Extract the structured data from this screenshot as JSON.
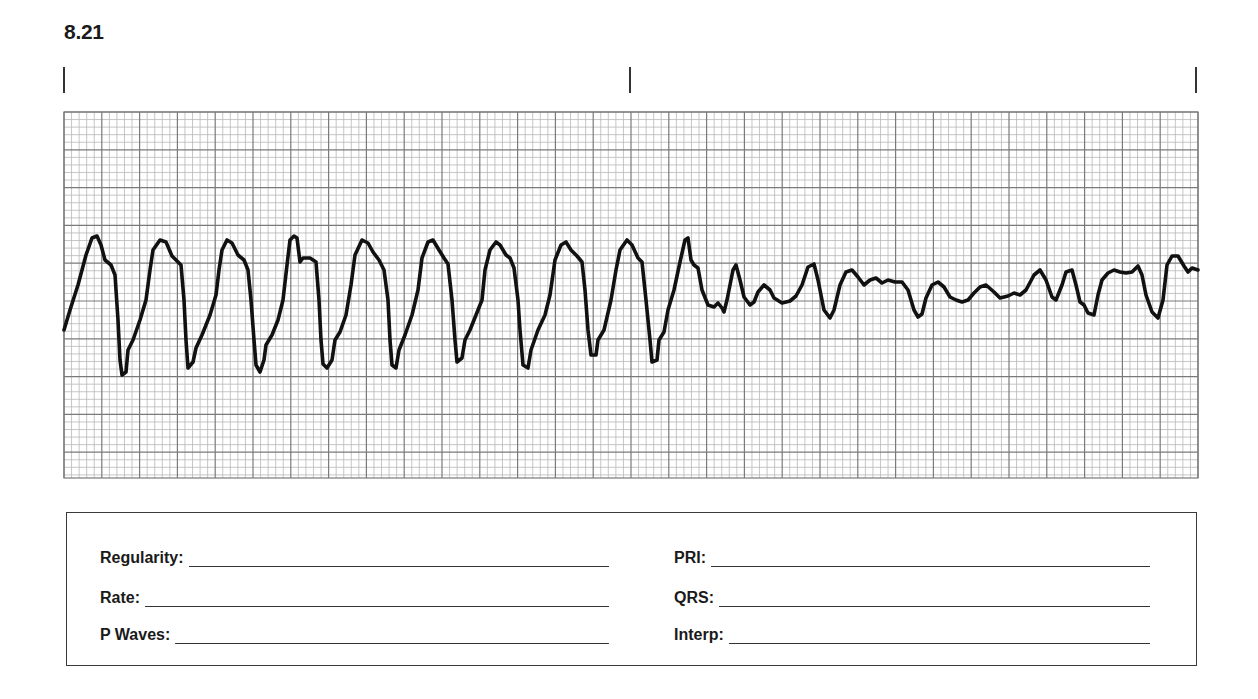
{
  "strip": {
    "number": "8.21",
    "tick_marks_x": [
      64,
      630,
      1196
    ],
    "grid": {
      "x0": 64,
      "y0": 112,
      "x1": 1198,
      "y1": 478,
      "minor_px": 7.56,
      "major_every": 5,
      "minor_color": "#b8b8b8",
      "major_color": "#7a7a7a"
    },
    "trace_color": "#111111"
  },
  "chart_data": {
    "type": "line",
    "title": "8.21",
    "xlabel": "",
    "ylabel": "",
    "grid": true,
    "trace_points": [
      [
        64,
        330
      ],
      [
        70,
        310
      ],
      [
        78,
        285
      ],
      [
        86,
        255
      ],
      [
        92,
        238
      ],
      [
        97,
        236
      ],
      [
        101,
        245
      ],
      [
        105,
        260
      ],
      [
        111,
        265
      ],
      [
        115,
        275
      ],
      [
        118,
        320
      ],
      [
        120,
        360
      ],
      [
        122,
        375
      ],
      [
        126,
        372
      ],
      [
        128,
        350
      ],
      [
        133,
        340
      ],
      [
        140,
        320
      ],
      [
        146,
        300
      ],
      [
        150,
        270
      ],
      [
        153,
        250
      ],
      [
        160,
        240
      ],
      [
        166,
        242
      ],
      [
        172,
        256
      ],
      [
        176,
        260
      ],
      [
        181,
        265
      ],
      [
        184,
        300
      ],
      [
        186,
        340
      ],
      [
        188,
        368
      ],
      [
        193,
        362
      ],
      [
        196,
        348
      ],
      [
        202,
        335
      ],
      [
        210,
        315
      ],
      [
        216,
        295
      ],
      [
        219,
        270
      ],
      [
        222,
        250
      ],
      [
        227,
        240
      ],
      [
        232,
        243
      ],
      [
        238,
        255
      ],
      [
        244,
        260
      ],
      [
        248,
        270
      ],
      [
        251,
        300
      ],
      [
        254,
        340
      ],
      [
        256,
        365
      ],
      [
        260,
        372
      ],
      [
        264,
        360
      ],
      [
        266,
        345
      ],
      [
        272,
        335
      ],
      [
        278,
        320
      ],
      [
        283,
        300
      ],
      [
        287,
        265
      ],
      [
        290,
        240
      ],
      [
        294,
        236
      ],
      [
        297,
        238
      ],
      [
        300,
        262
      ],
      [
        303,
        258
      ],
      [
        310,
        258
      ],
      [
        316,
        262
      ],
      [
        319,
        300
      ],
      [
        321,
        340
      ],
      [
        323,
        364
      ],
      [
        327,
        368
      ],
      [
        332,
        360
      ],
      [
        335,
        340
      ],
      [
        340,
        332
      ],
      [
        346,
        315
      ],
      [
        351,
        285
      ],
      [
        355,
        255
      ],
      [
        362,
        240
      ],
      [
        368,
        243
      ],
      [
        373,
        252
      ],
      [
        379,
        260
      ],
      [
        384,
        270
      ],
      [
        388,
        300
      ],
      [
        390,
        340
      ],
      [
        392,
        365
      ],
      [
        396,
        368
      ],
      [
        399,
        350
      ],
      [
        405,
        335
      ],
      [
        412,
        315
      ],
      [
        418,
        290
      ],
      [
        422,
        258
      ],
      [
        428,
        242
      ],
      [
        433,
        240
      ],
      [
        439,
        250
      ],
      [
        444,
        258
      ],
      [
        448,
        264
      ],
      [
        452,
        300
      ],
      [
        455,
        340
      ],
      [
        457,
        362
      ],
      [
        462,
        358
      ],
      [
        465,
        340
      ],
      [
        470,
        330
      ],
      [
        476,
        315
      ],
      [
        482,
        300
      ],
      [
        485,
        270
      ],
      [
        490,
        250
      ],
      [
        496,
        242
      ],
      [
        500,
        245
      ],
      [
        506,
        255
      ],
      [
        510,
        258
      ],
      [
        514,
        268
      ],
      [
        518,
        300
      ],
      [
        520,
        330
      ],
      [
        523,
        365
      ],
      [
        528,
        368
      ],
      [
        531,
        350
      ],
      [
        538,
        330
      ],
      [
        545,
        315
      ],
      [
        550,
        295
      ],
      [
        555,
        260
      ],
      [
        561,
        245
      ],
      [
        566,
        242
      ],
      [
        571,
        250
      ],
      [
        577,
        256
      ],
      [
        582,
        262
      ],
      [
        585,
        290
      ],
      [
        588,
        330
      ],
      [
        591,
        355
      ],
      [
        596,
        355
      ],
      [
        598,
        340
      ],
      [
        604,
        330
      ],
      [
        611,
        300
      ],
      [
        616,
        270
      ],
      [
        620,
        250
      ],
      [
        627,
        240
      ],
      [
        632,
        245
      ],
      [
        638,
        258
      ],
      [
        642,
        262
      ],
      [
        646,
        300
      ],
      [
        650,
        340
      ],
      [
        652,
        362
      ],
      [
        657,
        360
      ],
      [
        659,
        340
      ],
      [
        664,
        332
      ],
      [
        668,
        310
      ],
      [
        674,
        290
      ],
      [
        680,
        262
      ],
      [
        685,
        240
      ],
      [
        688,
        238
      ],
      [
        691,
        260
      ],
      [
        694,
        265
      ],
      [
        698,
        268
      ],
      [
        702,
        290
      ],
      [
        708,
        305
      ],
      [
        714,
        307
      ],
      [
        718,
        303
      ],
      [
        722,
        308
      ],
      [
        724,
        312
      ],
      [
        727,
        300
      ],
      [
        733,
        270
      ],
      [
        736,
        265
      ],
      [
        740,
        280
      ],
      [
        744,
        297
      ],
      [
        750,
        305
      ],
      [
        754,
        302
      ],
      [
        758,
        292
      ],
      [
        764,
        285
      ],
      [
        770,
        290
      ],
      [
        774,
        298
      ],
      [
        782,
        303
      ],
      [
        790,
        301
      ],
      [
        796,
        296
      ],
      [
        802,
        285
      ],
      [
        808,
        267
      ],
      [
        814,
        264
      ],
      [
        818,
        280
      ],
      [
        824,
        310
      ],
      [
        830,
        318
      ],
      [
        834,
        310
      ],
      [
        840,
        285
      ],
      [
        846,
        272
      ],
      [
        852,
        270
      ],
      [
        858,
        277
      ],
      [
        864,
        285
      ],
      [
        870,
        280
      ],
      [
        876,
        278
      ],
      [
        882,
        283
      ],
      [
        888,
        280
      ],
      [
        895,
        282
      ],
      [
        902,
        282
      ],
      [
        908,
        290
      ],
      [
        914,
        310
      ],
      [
        918,
        317
      ],
      [
        922,
        314
      ],
      [
        926,
        298
      ],
      [
        932,
        285
      ],
      [
        938,
        282
      ],
      [
        944,
        287
      ],
      [
        950,
        297
      ],
      [
        956,
        300
      ],
      [
        962,
        302
      ],
      [
        968,
        300
      ],
      [
        974,
        293
      ],
      [
        980,
        287
      ],
      [
        986,
        285
      ],
      [
        994,
        292
      ],
      [
        1000,
        298
      ],
      [
        1008,
        296
      ],
      [
        1014,
        293
      ],
      [
        1020,
        295
      ],
      [
        1026,
        290
      ],
      [
        1034,
        275
      ],
      [
        1040,
        270
      ],
      [
        1046,
        280
      ],
      [
        1052,
        297
      ],
      [
        1056,
        300
      ],
      [
        1062,
        285
      ],
      [
        1066,
        272
      ],
      [
        1072,
        270
      ],
      [
        1076,
        285
      ],
      [
        1080,
        302
      ],
      [
        1084,
        305
      ],
      [
        1088,
        313
      ],
      [
        1094,
        315
      ],
      [
        1098,
        295
      ],
      [
        1102,
        280
      ],
      [
        1108,
        273
      ],
      [
        1114,
        270
      ],
      [
        1120,
        272
      ],
      [
        1126,
        273
      ],
      [
        1132,
        272
      ],
      [
        1138,
        266
      ],
      [
        1142,
        275
      ],
      [
        1146,
        295
      ],
      [
        1152,
        312
      ],
      [
        1158,
        318
      ],
      [
        1163,
        300
      ],
      [
        1167,
        265
      ],
      [
        1172,
        256
      ],
      [
        1178,
        256
      ],
      [
        1184,
        266
      ],
      [
        1188,
        272
      ],
      [
        1192,
        268
      ],
      [
        1198,
        270
      ]
    ]
  },
  "form": {
    "left_fields": [
      {
        "label": "Regularity:",
        "value": ""
      },
      {
        "label": "Rate:",
        "value": ""
      },
      {
        "label": "P Waves:",
        "value": ""
      }
    ],
    "right_fields": [
      {
        "label": "PRI:",
        "value": ""
      },
      {
        "label": "QRS:",
        "value": ""
      },
      {
        "label": "Interp:",
        "value": ""
      }
    ]
  }
}
